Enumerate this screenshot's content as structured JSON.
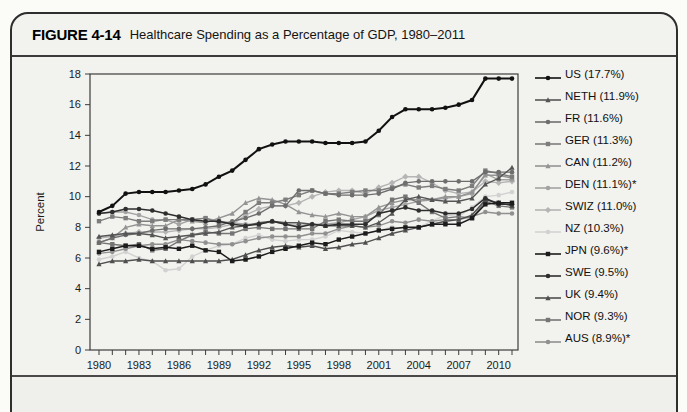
{
  "figure": {
    "label": "FIGURE 4-14",
    "title": "Healthcare Spending as a Percentage of GDP, 1980–2011"
  },
  "chart_data": {
    "type": "line",
    "title": "Healthcare Spending as a Percentage of GDP, 1980–2011",
    "xlabel": "",
    "ylabel": "Percent",
    "ylim": [
      0,
      18
    ],
    "yticks": [
      0,
      2,
      4,
      6,
      8,
      10,
      12,
      14,
      16,
      18
    ],
    "grid": false,
    "legend_position": "right",
    "x": [
      1980,
      1981,
      1982,
      1983,
      1984,
      1985,
      1986,
      1987,
      1988,
      1989,
      1990,
      1991,
      1992,
      1993,
      1994,
      1995,
      1996,
      1997,
      1998,
      1999,
      2000,
      2001,
      2002,
      2003,
      2004,
      2005,
      2006,
      2007,
      2008,
      2009,
      2010,
      2011
    ],
    "xtick_labels": [
      1980,
      1983,
      1986,
      1989,
      1992,
      1995,
      1998,
      2001,
      2004,
      2007,
      2010
    ],
    "series": [
      {
        "name": "US",
        "label": "US (17.7%)",
        "color": "#111111",
        "marker": "circle",
        "line_width": 2,
        "values": [
          9.0,
          9.4,
          10.2,
          10.3,
          10.3,
          10.3,
          10.4,
          10.5,
          10.8,
          11.3,
          11.7,
          12.4,
          13.1,
          13.4,
          13.6,
          13.6,
          13.6,
          13.5,
          13.5,
          13.5,
          13.6,
          14.3,
          15.2,
          15.7,
          15.7,
          15.7,
          15.8,
          16.0,
          16.3,
          17.7,
          17.7,
          17.7
        ]
      },
      {
        "name": "NETH",
        "label": "NETH (11.9%)",
        "color": "#555555",
        "marker": "triangle",
        "line_width": 1.4,
        "values": [
          7.4,
          7.5,
          7.6,
          7.6,
          7.5,
          7.3,
          7.4,
          7.5,
          7.6,
          7.7,
          8.0,
          8.1,
          8.3,
          8.4,
          8.3,
          8.3,
          8.2,
          8.1,
          8.1,
          8.1,
          8.0,
          8.3,
          8.9,
          9.8,
          10.0,
          9.8,
          9.7,
          9.7,
          9.9,
          10.8,
          11.2,
          11.9
        ]
      },
      {
        "name": "FR",
        "label": "FR (11.6%)",
        "color": "#6e6e6e",
        "marker": "circle",
        "line_width": 1.4,
        "values": [
          7.0,
          7.3,
          7.5,
          7.6,
          7.8,
          7.9,
          7.9,
          7.9,
          8.0,
          8.1,
          8.4,
          8.6,
          8.9,
          9.4,
          9.4,
          10.4,
          10.4,
          10.2,
          10.1,
          10.1,
          10.1,
          10.2,
          10.5,
          10.9,
          11.0,
          11.0,
          11.0,
          11.0,
          11.0,
          11.6,
          11.6,
          11.6
        ]
      },
      {
        "name": "GER",
        "label": "GER (11.3%)",
        "color": "#7d7d7d",
        "marker": "square",
        "line_width": 1.4,
        "values": [
          8.4,
          8.7,
          8.6,
          8.4,
          8.4,
          8.5,
          8.5,
          8.5,
          8.6,
          8.3,
          8.3,
          9.0,
          9.6,
          9.6,
          9.8,
          10.1,
          10.4,
          10.2,
          10.2,
          10.3,
          10.4,
          10.4,
          10.6,
          10.8,
          10.6,
          10.7,
          10.5,
          10.4,
          10.7,
          11.7,
          11.5,
          11.3
        ]
      },
      {
        "name": "CAN",
        "label": "CAN (11.2%)",
        "color": "#949494",
        "marker": "triangle",
        "line_width": 1.4,
        "values": [
          7.0,
          7.3,
          8.0,
          8.2,
          8.1,
          8.1,
          8.5,
          8.4,
          8.3,
          8.6,
          8.9,
          9.6,
          9.9,
          9.8,
          9.5,
          9.0,
          8.8,
          8.7,
          8.9,
          8.7,
          8.7,
          9.3,
          9.6,
          9.8,
          9.8,
          9.8,
          10.0,
          10.0,
          10.3,
          11.4,
          11.4,
          11.2
        ]
      },
      {
        "name": "DEN",
        "label": "DEN (11.1%)*",
        "color": "#a3a3a3",
        "marker": "circle",
        "line_width": 1.4,
        "values": [
          8.9,
          9.0,
          9.0,
          8.8,
          8.5,
          8.5,
          8.2,
          8.5,
          8.6,
          8.4,
          8.3,
          8.2,
          8.2,
          8.4,
          8.2,
          8.1,
          8.2,
          8.2,
          8.3,
          8.5,
          8.7,
          9.1,
          9.3,
          9.5,
          9.7,
          9.8,
          9.9,
          10.0,
          10.2,
          11.5,
          11.1,
          11.1
        ]
      },
      {
        "name": "SWIZ",
        "label": "SWIZ (11.0%)",
        "color": "#b5b5b5",
        "marker": "diamond",
        "line_width": 1.4,
        "values": [
          7.3,
          7.4,
          7.6,
          7.7,
          7.7,
          7.7,
          7.8,
          7.9,
          7.9,
          8.0,
          8.2,
          8.8,
          9.2,
          9.4,
          9.4,
          9.6,
          10.0,
          10.3,
          10.4,
          10.4,
          10.2,
          10.6,
          10.9,
          11.3,
          11.3,
          10.9,
          10.4,
          10.2,
          10.3,
          11.0,
          10.9,
          11.0
        ]
      },
      {
        "name": "NZ",
        "label": "NZ (10.3%)",
        "color": "#d2d2d2",
        "marker": "circle",
        "line_width": 1.4,
        "values": [
          5.9,
          6.1,
          6.4,
          6.0,
          5.8,
          5.2,
          5.3,
          6.1,
          6.5,
          6.8,
          6.9,
          7.3,
          7.5,
          7.2,
          7.1,
          7.2,
          7.2,
          7.4,
          7.8,
          7.7,
          7.6,
          7.8,
          8.0,
          7.9,
          8.0,
          8.4,
          8.8,
          8.7,
          9.3,
          10.0,
          10.1,
          10.3
        ]
      },
      {
        "name": "JPN",
        "label": "JPN (9.6%)*",
        "color": "#1c1c1c",
        "marker": "square",
        "line_width": 1.5,
        "values": [
          6.4,
          6.6,
          6.8,
          6.8,
          6.6,
          6.7,
          6.6,
          6.8,
          6.5,
          6.4,
          5.8,
          5.9,
          6.1,
          6.4,
          6.6,
          6.8,
          7.0,
          6.9,
          7.2,
          7.4,
          7.6,
          7.8,
          7.9,
          8.0,
          8.0,
          8.2,
          8.2,
          8.2,
          8.6,
          9.5,
          9.6,
          9.6
        ]
      },
      {
        "name": "SWE",
        "label": "SWE (9.5%)",
        "color": "#2e2e2e",
        "marker": "circle",
        "line_width": 1.5,
        "values": [
          8.9,
          9.0,
          9.2,
          9.2,
          9.1,
          8.9,
          8.7,
          8.5,
          8.4,
          8.4,
          8.2,
          8.1,
          8.2,
          8.4,
          8.2,
          8.0,
          8.2,
          8.1,
          8.2,
          8.2,
          8.2,
          8.9,
          9.1,
          9.3,
          9.1,
          9.1,
          8.9,
          8.9,
          9.2,
          9.9,
          9.5,
          9.5
        ]
      },
      {
        "name": "UK",
        "label": "UK (9.4%)",
        "color": "#4f4f4f",
        "marker": "triangle",
        "line_width": 1.4,
        "values": [
          5.6,
          5.8,
          5.8,
          5.9,
          5.8,
          5.8,
          5.8,
          5.8,
          5.8,
          5.8,
          5.9,
          6.2,
          6.5,
          6.7,
          6.8,
          6.7,
          6.8,
          6.6,
          6.7,
          6.9,
          7.0,
          7.3,
          7.6,
          7.8,
          8.0,
          8.2,
          8.4,
          8.5,
          8.8,
          9.8,
          9.6,
          9.4
        ]
      },
      {
        "name": "NOR",
        "label": "NOR (9.3%)",
        "color": "#757575",
        "marker": "square",
        "line_width": 1.4,
        "values": [
          7.0,
          6.9,
          6.8,
          6.9,
          6.5,
          6.6,
          7.1,
          7.5,
          7.7,
          7.6,
          7.6,
          7.9,
          8.0,
          7.9,
          7.9,
          7.9,
          7.9,
          8.4,
          8.5,
          8.4,
          8.4,
          8.8,
          9.8,
          10.0,
          9.6,
          9.0,
          8.6,
          8.7,
          8.6,
          9.7,
          9.4,
          9.3
        ]
      },
      {
        "name": "AUS",
        "label": "AUS (8.9%)*",
        "color": "#909090",
        "marker": "circle",
        "line_width": 1.4,
        "values": [
          6.3,
          6.4,
          6.6,
          6.8,
          6.9,
          6.9,
          7.2,
          7.1,
          7.0,
          6.9,
          6.9,
          7.1,
          7.3,
          7.4,
          7.4,
          7.4,
          7.6,
          7.6,
          7.9,
          8.1,
          8.0,
          8.1,
          8.4,
          8.3,
          8.5,
          8.4,
          8.5,
          8.5,
          8.7,
          9.0,
          8.9,
          8.9
        ]
      }
    ]
  }
}
